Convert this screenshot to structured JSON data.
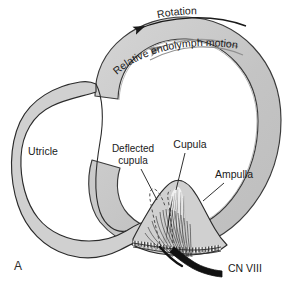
{
  "figure": {
    "panel_label": "A",
    "title_hidden": "",
    "colors": {
      "tissue_fill": "#d0d0d0",
      "tissue_stroke": "#2b2b2b",
      "canal_tube_fill": "#c8c8c8",
      "lumen_fill": "#ffffff",
      "cupula_fill": "#e8e8e8",
      "nerve_black": "#111111",
      "text": "#1a1a1a",
      "endolymph_arrow": "#8c8c8c",
      "deflected_dash": "#555555"
    }
  },
  "labels": {
    "rotation": "Rotation",
    "endolymph_motion": "Relative endolymph motion",
    "utricle": "Utricle",
    "deflected_cupula_line1": "Deflected",
    "deflected_cupula_line2": "cupula",
    "cupula": "Cupula",
    "ampulla": "Ampulla",
    "cn8": "CN VIII"
  },
  "icons": {
    "rotation_arrow": "curved-arrow-left-icon",
    "endolymph_arrow": "curved-arrow-left-icon",
    "nerve_trunk": "nerve-trunk-icon"
  }
}
